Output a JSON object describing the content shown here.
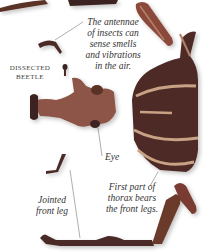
{
  "figure": {
    "subject": "Dissected beetle",
    "colors": {
      "background": "#ffffff",
      "body_dark": "#4a2a26",
      "body_red": "#7a3a30",
      "stripe": "#c9a184",
      "leg": "#6b3a2c",
      "text": "#333333"
    }
  },
  "labels": {
    "antennae": [
      "The antennae",
      "of insects can",
      "sense smells",
      "and vibrations",
      "in the air."
    ],
    "title": [
      "DISSECTED",
      "BEETLE"
    ],
    "eye": "Eye",
    "thorax": [
      "First part of",
      "thorax bears",
      "the front legs."
    ],
    "leg": [
      "Jointed",
      "front leg"
    ]
  }
}
